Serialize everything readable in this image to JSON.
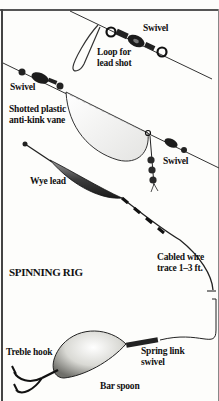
{
  "diagram": {
    "title": "SPINNING RIG",
    "labels": {
      "swivel_top": "Swivel",
      "loop_line1": "Loop for",
      "loop_line2": "lead shot",
      "swivel_left": "Swivel",
      "vane_line1": "Shotted plastic",
      "vane_line2": "anti-kink vane",
      "swivel_right": "Swivel",
      "wye_lead": "Wye lead",
      "wire_line1": "Cabled wire",
      "wire_line2": "trace 1–3 ft.",
      "treble_hook": "Treble hook",
      "spring_line1": "Spring link",
      "spring_line2": "swivel",
      "bar_spoon": "Bar spoon"
    },
    "components": [
      "swivel-with-lead-shot-loop",
      "shotted-plastic-anti-kink-vane",
      "wye-lead",
      "cabled-wire-trace",
      "spring-link-swivel",
      "bar-spoon",
      "treble-hook"
    ]
  }
}
